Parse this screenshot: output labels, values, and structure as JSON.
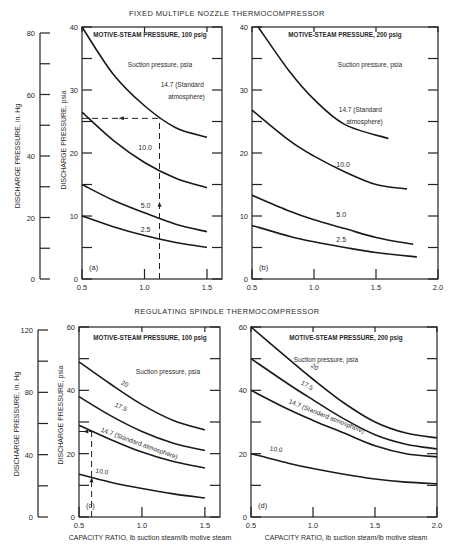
{
  "section_titles": {
    "top": "FIXED MULTIPLE NOZZLE THERMOCOMPRESSOR",
    "bottom": "REGULATING SPINDLE THERMOCOMPRESSOR"
  },
  "axis_labels": {
    "left_hg": "DISCHARGE PRESSURE, in. Hg",
    "left_psia": "DISCHARGE PRESSURE, psia",
    "x": "CAPACITY RATIO, lb suction steam/lb motive steam"
  },
  "legend_caption": "Suction pressure, psia",
  "chart_data": [
    {
      "id": "a",
      "type": "line",
      "title": "MOTIVE-STEAM PRESSURE, 100 psig",
      "panel_label": "(a)",
      "xlabel": "",
      "ylabel": "DISCHARGE PRESSURE, psia",
      "secondary_ylabel": "DISCHARGE PRESSURE, in. Hg",
      "xlim": [
        0.5,
        1.6
      ],
      "ylim": [
        0,
        40
      ],
      "secondary_ylim": [
        0,
        80
      ],
      "x_ticks": [
        "0.5",
        "1.0",
        "1.5"
      ],
      "y_ticks": [
        "0",
        "10",
        "20",
        "30",
        "40"
      ],
      "secondary_y_ticks": [
        "0",
        "20",
        "40",
        "60",
        "80"
      ],
      "series": [
        {
          "name": "14.7 (Standard atmosphere)",
          "x": [
            0.5,
            0.75,
            1.0,
            1.25,
            1.5
          ],
          "y": [
            40,
            32.5,
            27.5,
            24,
            22.5
          ]
        },
        {
          "name": "10.0",
          "x": [
            0.5,
            0.75,
            1.0,
            1.25,
            1.5
          ],
          "y": [
            26.5,
            22,
            18.5,
            16,
            14.5
          ]
        },
        {
          "name": "5.0",
          "x": [
            0.5,
            0.75,
            1.0,
            1.25,
            1.5
          ],
          "y": [
            15,
            12.5,
            10.5,
            8.7,
            7.5
          ]
        },
        {
          "name": "2.5",
          "x": [
            0.5,
            0.75,
            1.0,
            1.25,
            1.5
          ],
          "y": [
            10,
            8.3,
            6.9,
            5.8,
            5
          ]
        }
      ],
      "annotation": {
        "type": "dashed-guide",
        "x": 1.12,
        "y": 25.5
      }
    },
    {
      "id": "b",
      "type": "line",
      "title": "MOTIVE-STEAM PRESSURE, 200 psig",
      "panel_label": "(b)",
      "xlim": [
        0.5,
        2.0
      ],
      "ylim": [
        0,
        40
      ],
      "x_ticks": [
        "0.5",
        "1.0",
        "1.5",
        "2.0"
      ],
      "y_ticks": [
        "0",
        "10",
        "20",
        "30",
        "40"
      ],
      "series": [
        {
          "name": "14.7 (Standard atmosphere)",
          "x": [
            0.55,
            0.8,
            1.0,
            1.25,
            1.6
          ],
          "y": [
            40,
            33,
            28.5,
            24.5,
            22.3
          ]
        },
        {
          "name": "10.0",
          "x": [
            0.5,
            0.8,
            1.0,
            1.25,
            1.5,
            1.75
          ],
          "y": [
            26.8,
            22,
            19.5,
            17,
            15,
            14.3
          ]
        },
        {
          "name": "5.0",
          "x": [
            0.5,
            0.8,
            1.0,
            1.25,
            1.5,
            1.8
          ],
          "y": [
            13.3,
            10.8,
            9.4,
            8,
            6.6,
            5.5
          ]
        },
        {
          "name": "2.5",
          "x": [
            0.5,
            0.8,
            1.0,
            1.25,
            1.5,
            1.83
          ],
          "y": [
            8.5,
            6.8,
            5.9,
            5,
            4.2,
            3.5
          ]
        }
      ]
    },
    {
      "id": "c",
      "type": "line",
      "title": "MOTIVE-STEAM PRESSURE, 100 psig",
      "panel_label": "(c)",
      "xlabel": "CAPACITY RATIO, lb suction steam/lb motive steam",
      "ylabel": "DISCHARGE PRESSURE, psia",
      "secondary_ylabel": "DISCHARGE PRESSURE, in. Hg",
      "xlim": [
        0.5,
        1.6
      ],
      "ylim": [
        0,
        60
      ],
      "secondary_ylim": [
        0,
        120
      ],
      "x_ticks": [
        "0.5",
        "1.0",
        "1.5"
      ],
      "y_ticks": [
        "0",
        "20",
        "40",
        "60"
      ],
      "secondary_y_ticks": [
        "0",
        "40",
        "80",
        "120"
      ],
      "series": [
        {
          "name": "20",
          "x": [
            0.5,
            0.75,
            1.0,
            1.25,
            1.5
          ],
          "y": [
            49,
            42,
            35.5,
            30.5,
            27.5
          ]
        },
        {
          "name": "17.5",
          "x": [
            0.5,
            0.75,
            1.0,
            1.25,
            1.5
          ],
          "y": [
            38,
            32,
            27,
            23.3,
            21
          ]
        },
        {
          "name": "14.7 (Standard atmosphere)",
          "x": [
            0.5,
            0.75,
            1.0,
            1.25,
            1.5
          ],
          "y": [
            29,
            24.5,
            20.5,
            17.5,
            15.5
          ]
        },
        {
          "name": "10.0",
          "x": [
            0.5,
            0.75,
            1.0,
            1.25,
            1.5
          ],
          "y": [
            13.5,
            11,
            9,
            7.3,
            6
          ]
        }
      ],
      "annotation": {
        "type": "dashed-guide",
        "x": 0.6,
        "y": 27
      }
    },
    {
      "id": "d",
      "type": "line",
      "title": "MOTIVE-STEAM PRESSURE, 200 psig",
      "panel_label": "(d)",
      "xlabel": "CAPACITY RATIO, lb suction steam/lb motive steam",
      "xlim": [
        0.5,
        2.0
      ],
      "ylim": [
        0,
        60
      ],
      "x_ticks": [
        "0.5",
        "1.0",
        "1.5",
        "2.0"
      ],
      "y_ticks": [
        "0",
        "20",
        "40",
        "60"
      ],
      "series": [
        {
          "name": "20",
          "x": [
            0.5,
            0.8,
            1.0,
            1.25,
            1.5,
            1.75,
            2.0
          ],
          "y": [
            60,
            50,
            43.5,
            36,
            30,
            26.5,
            25
          ]
        },
        {
          "name": "17.5",
          "x": [
            0.5,
            0.8,
            1.0,
            1.25,
            1.5,
            1.75,
            2.0
          ],
          "y": [
            50,
            42,
            37,
            31,
            26,
            23,
            21.5
          ]
        },
        {
          "name": "14.7 (Standard atmosphere)",
          "x": [
            0.5,
            0.8,
            1.0,
            1.25,
            1.5,
            1.75,
            2.0
          ],
          "y": [
            40,
            34,
            30.5,
            26.5,
            22.5,
            20,
            19
          ]
        },
        {
          "name": "10.0",
          "x": [
            0.5,
            0.8,
            1.0,
            1.25,
            1.5,
            1.75,
            2.0
          ],
          "y": [
            20,
            17,
            15.3,
            13.5,
            12,
            11,
            10.5
          ]
        }
      ]
    }
  ]
}
